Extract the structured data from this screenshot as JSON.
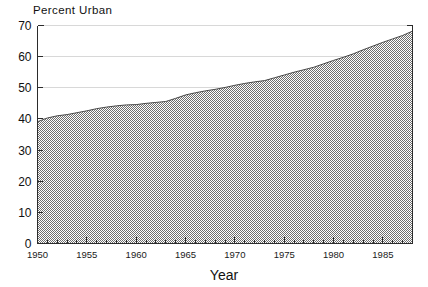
{
  "chart_data": {
    "type": "area",
    "title": "Percent Urban",
    "xlabel": "Year",
    "ylabel": "",
    "xlim": [
      1950,
      1988
    ],
    "ylim": [
      0,
      70
    ],
    "grid": true,
    "legend": "none",
    "fill_color": "#9a9a9a",
    "line_color": "#4a4a4a",
    "axis_color": "#2b2b2b",
    "grid_color": "#c8c8c8",
    "background_color": "#ffffff",
    "x_major_ticks": [
      1950,
      1955,
      1960,
      1965,
      1970,
      1975,
      1980,
      1985
    ],
    "x_major_tick_labels": [
      "1950",
      "1955",
      "1960",
      "1965",
      "1970",
      "1975",
      "1980",
      "1985"
    ],
    "x_minor_tick_step": 1,
    "y_ticks": [
      0,
      10,
      20,
      30,
      40,
      50,
      60,
      70
    ],
    "y_tick_labels": [
      "0",
      "10",
      "20",
      "30",
      "40",
      "50",
      "60",
      "70"
    ],
    "x": [
      1950,
      1951,
      1952,
      1953,
      1954,
      1955,
      1956,
      1957,
      1958,
      1959,
      1960,
      1961,
      1962,
      1963,
      1964,
      1965,
      1966,
      1967,
      1968,
      1969,
      1970,
      1971,
      1972,
      1973,
      1974,
      1975,
      1976,
      1977,
      1978,
      1979,
      1980,
      1981,
      1982,
      1983,
      1984,
      1985,
      1986,
      1987,
      1988
    ],
    "values": [
      39.1,
      40.3,
      41.0,
      41.4,
      42.0,
      42.6,
      43.3,
      43.8,
      44.2,
      44.5,
      44.6,
      45.0,
      45.3,
      45.6,
      46.6,
      47.7,
      48.4,
      49.0,
      49.5,
      50.1,
      50.8,
      51.4,
      51.9,
      52.3,
      53.2,
      54.1,
      55.0,
      55.8,
      56.6,
      57.7,
      58.8,
      59.8,
      60.9,
      62.2,
      63.4,
      64.6,
      65.7,
      66.8,
      68.2
    ],
    "series": [
      {
        "name": "Percent Urban",
        "values": [
          39.1,
          40.3,
          41.0,
          41.4,
          42.0,
          42.6,
          43.3,
          43.8,
          44.2,
          44.5,
          44.6,
          45.0,
          45.3,
          45.6,
          46.6,
          47.7,
          48.4,
          49.0,
          49.5,
          50.1,
          50.8,
          51.4,
          51.9,
          52.3,
          53.2,
          54.1,
          55.0,
          55.8,
          56.6,
          57.7,
          58.8,
          59.8,
          60.9,
          62.2,
          63.4,
          64.6,
          65.7,
          66.8,
          68.2
        ]
      }
    ]
  }
}
